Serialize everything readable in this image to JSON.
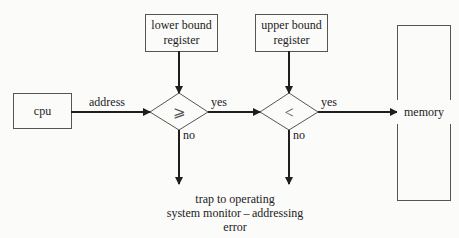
{
  "diagram": {
    "nodes": {
      "cpu": {
        "label": "cpu"
      },
      "lower_bound": {
        "label_line1": "lower bound",
        "label_line2": "register"
      },
      "upper_bound": {
        "label_line1": "upper bound",
        "label_line2": "register"
      },
      "compare_lower": {
        "symbol": "⩾"
      },
      "compare_upper": {
        "symbol": "<"
      },
      "memory": {
        "label": "memory"
      },
      "trap": {
        "line1": "trap to operating",
        "line2": "system monitor – addressing",
        "line3": "error"
      }
    },
    "edges": {
      "address": "address",
      "yes1": "yes",
      "yes2": "yes",
      "no1": "no",
      "no2": "no"
    },
    "colors": {
      "line": "#1e1e1e",
      "box_border": "#555555",
      "background": "#fbfbfa"
    }
  }
}
